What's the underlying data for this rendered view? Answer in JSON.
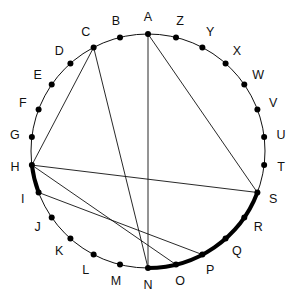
{
  "diagram": {
    "type": "circle-with-labeled-points",
    "center": [
      148,
      151
    ],
    "radius": 117,
    "label_radius": 134,
    "start_angle_deg": -90,
    "direction": "counterclockwise",
    "points": [
      "A",
      "B",
      "C",
      "D",
      "E",
      "F",
      "G",
      "H",
      "I",
      "J",
      "K",
      "L",
      "M",
      "N",
      "O",
      "P",
      "Q",
      "R",
      "S",
      "T",
      "U",
      "V",
      "W",
      "X",
      "Y",
      "Z"
    ],
    "chords": [
      [
        "A",
        "N"
      ],
      [
        "A",
        "S"
      ],
      [
        "C",
        "H"
      ],
      [
        "C",
        "N"
      ],
      [
        "H",
        "S"
      ],
      [
        "H",
        "O"
      ],
      [
        "I",
        "P"
      ]
    ],
    "thick_arcs": [
      [
        "H",
        "I"
      ],
      [
        "N",
        "S"
      ]
    ]
  }
}
